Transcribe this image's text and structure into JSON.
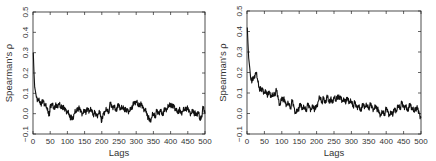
{
  "chart_data": [
    {
      "type": "line",
      "title": "",
      "xlabel": "Lags",
      "ylabel": "Spearman's ρ",
      "xlim": [
        0,
        500
      ],
      "ylim": [
        -0.1,
        0.5
      ],
      "xticks": [
        0,
        50,
        100,
        150,
        200,
        250,
        300,
        350,
        400,
        450,
        500
      ],
      "yticks": [
        -0.1,
        0.0,
        0.1,
        0.2,
        0.3,
        0.4,
        0.5
      ],
      "xtick_labels": [
        "0",
        "50",
        "100",
        "150",
        "200",
        "250",
        "300",
        "350",
        "400",
        "450",
        "500"
      ],
      "ytick_labels": [
        "−0.1",
        "0.0",
        "0.1",
        "0.2",
        "0.3",
        "0.4",
        "0.5"
      ],
      "grid": false,
      "series": [
        {
          "name": "left",
          "x": [
            1,
            3,
            5,
            8,
            10,
            15,
            20,
            25,
            30,
            35,
            40,
            45,
            48,
            50,
            55,
            60,
            65,
            70,
            75,
            80,
            85,
            90,
            95,
            100,
            105,
            110,
            115,
            120,
            125,
            130,
            135,
            140,
            145,
            150,
            155,
            160,
            165,
            170,
            175,
            180,
            185,
            190,
            195,
            200,
            205,
            210,
            215,
            220,
            225,
            230,
            235,
            240,
            245,
            250,
            255,
            260,
            265,
            270,
            275,
            280,
            285,
            290,
            295,
            300,
            305,
            310,
            315,
            320,
            325,
            330,
            335,
            340,
            345,
            350,
            355,
            360,
            365,
            370,
            375,
            380,
            385,
            390,
            395,
            400,
            405,
            410,
            415,
            420,
            425,
            430,
            435,
            440,
            445,
            450,
            455,
            460,
            465,
            470,
            475,
            480,
            485,
            490,
            495,
            500
          ],
          "y": [
            0.3,
            0.2,
            0.13,
            0.1,
            0.08,
            0.07,
            0.06,
            0.05,
            0.06,
            0.04,
            0.03,
            0.01,
            -0.01,
            0.04,
            0.05,
            0.03,
            0.04,
            0.03,
            0.05,
            0.03,
            0.04,
            0.02,
            0.02,
            0.01,
            0.0,
            -0.02,
            -0.03,
            0.0,
            0.01,
            0.03,
            0.02,
            0.01,
            0.0,
            0.02,
            0.01,
            0.02,
            0.01,
            0.02,
            0.0,
            0.0,
            -0.01,
            0.0,
            0.01,
            -0.04,
            0.0,
            0.01,
            0.02,
            0.01,
            0.05,
            0.03,
            0.04,
            0.02,
            0.03,
            0.04,
            0.02,
            0.03,
            0.03,
            0.01,
            0.02,
            0.01,
            0.03,
            0.04,
            0.05,
            0.06,
            0.04,
            0.05,
            0.04,
            0.03,
            0.02,
            0.01,
            -0.02,
            -0.04,
            -0.02,
            0.0,
            -0.01,
            0.01,
            0.0,
            0.02,
            0.0,
            0.01,
            0.02,
            0.02,
            0.04,
            0.05,
            0.03,
            0.04,
            0.02,
            0.01,
            0.02,
            0.0,
            0.01,
            0.02,
            0.03,
            0.02,
            0.01,
            0.0,
            0.02,
            0.0,
            -0.01,
            0.01,
            -0.03,
            -0.01,
            0.03,
            0.0
          ]
        }
      ]
    },
    {
      "type": "line",
      "title": "",
      "xlabel": "Lags",
      "ylabel": "Spearman's ρ",
      "xlim": [
        0,
        500
      ],
      "ylim": [
        -0.1,
        0.5
      ],
      "xticks": [
        0,
        50,
        100,
        150,
        200,
        250,
        300,
        350,
        400,
        450,
        500
      ],
      "yticks": [
        -0.1,
        0.0,
        0.1,
        0.2,
        0.3,
        0.4,
        0.5
      ],
      "xtick_labels": [
        "0",
        "50",
        "100",
        "150",
        "200",
        "250",
        "300",
        "350",
        "400",
        "450",
        "500"
      ],
      "ytick_labels": [
        "−0.1",
        "0.0",
        "0.1",
        "0.2",
        "0.3",
        "0.4",
        "0.5"
      ],
      "grid": false,
      "series": [
        {
          "name": "right",
          "x": [
            1,
            3,
            5,
            8,
            10,
            15,
            20,
            25,
            30,
            35,
            40,
            45,
            50,
            55,
            60,
            65,
            70,
            75,
            80,
            85,
            90,
            95,
            100,
            105,
            110,
            115,
            120,
            125,
            130,
            135,
            140,
            145,
            150,
            155,
            160,
            165,
            170,
            175,
            180,
            185,
            190,
            195,
            200,
            205,
            210,
            215,
            220,
            225,
            230,
            235,
            240,
            245,
            250,
            255,
            260,
            265,
            270,
            275,
            280,
            285,
            290,
            295,
            300,
            305,
            310,
            315,
            320,
            325,
            330,
            335,
            340,
            345,
            350,
            355,
            360,
            365,
            370,
            375,
            380,
            385,
            390,
            395,
            400,
            405,
            410,
            415,
            420,
            425,
            430,
            435,
            440,
            445,
            450,
            455,
            460,
            465,
            470,
            475,
            480,
            485,
            490,
            495,
            500
          ],
          "y": [
            0.42,
            0.34,
            0.27,
            0.22,
            0.18,
            0.16,
            0.17,
            0.2,
            0.17,
            0.13,
            0.11,
            0.12,
            0.1,
            0.11,
            0.09,
            0.1,
            0.08,
            0.09,
            0.1,
            0.11,
            0.07,
            0.04,
            0.08,
            0.07,
            0.05,
            0.04,
            0.05,
            0.03,
            0.06,
            0.03,
            0.0,
            0.02,
            0.03,
            0.04,
            0.02,
            0.03,
            0.02,
            0.04,
            0.03,
            0.02,
            0.04,
            0.02,
            0.03,
            0.06,
            0.08,
            0.06,
            0.07,
            0.05,
            0.09,
            0.06,
            0.07,
            0.05,
            0.08,
            0.06,
            0.09,
            0.07,
            0.08,
            0.06,
            0.07,
            0.06,
            0.07,
            0.05,
            0.06,
            0.04,
            0.05,
            0.03,
            0.04,
            0.02,
            0.03,
            0.04,
            0.03,
            0.04,
            0.03,
            0.04,
            0.03,
            0.02,
            0.04,
            0.02,
            0.0,
            -0.01,
            0.01,
            0.0,
            0.02,
            0.01,
            -0.01,
            0.01,
            0.0,
            0.02,
            0.01,
            0.04,
            0.03,
            0.05,
            0.03,
            0.04,
            0.02,
            0.03,
            0.04,
            0.02,
            0.01,
            0.03,
            0.02,
            0.0,
            -0.02
          ]
        }
      ]
    }
  ]
}
